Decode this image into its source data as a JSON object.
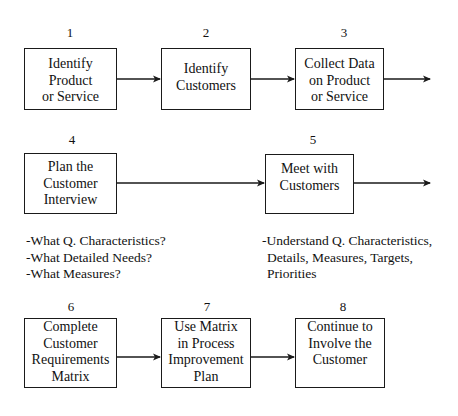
{
  "diagram": {
    "type": "process-flow",
    "steps": [
      {
        "number": "1",
        "lines": [
          "Identify",
          "Product",
          "or Service"
        ]
      },
      {
        "number": "2",
        "lines": [
          "Identify",
          "Customers"
        ]
      },
      {
        "number": "3",
        "lines": [
          "Collect Data",
          "on Product",
          "or Service"
        ]
      },
      {
        "number": "4",
        "lines": [
          "Plan the",
          "Customer",
          "Interview"
        ]
      },
      {
        "number": "5",
        "lines": [
          "Meet with",
          "Customers"
        ]
      },
      {
        "number": "6",
        "lines": [
          "Complete",
          "Customer",
          "Requirements",
          "Matrix"
        ]
      },
      {
        "number": "7",
        "lines": [
          "Use Matrix",
          "in Process",
          "Improvement",
          "Plan"
        ]
      },
      {
        "number": "8",
        "lines": [
          "Continue to",
          "Involve the",
          "Customer"
        ]
      }
    ],
    "notes": {
      "step4": [
        "-What Q. Characteristics?",
        "-What Detailed Needs?",
        "-What Measures?"
      ],
      "step5": [
        "-Understand Q. Characteristics,",
        " Details, Measures, Targets,",
        " Priorities"
      ]
    },
    "edges": [
      {
        "from": "1",
        "to": "2"
      },
      {
        "from": "2",
        "to": "3"
      },
      {
        "from": "3",
        "to": "continues"
      },
      {
        "from": "4",
        "to": "5"
      },
      {
        "from": "5",
        "to": "continues"
      },
      {
        "from": "6",
        "to": "7"
      },
      {
        "from": "7",
        "to": "8"
      }
    ]
  }
}
